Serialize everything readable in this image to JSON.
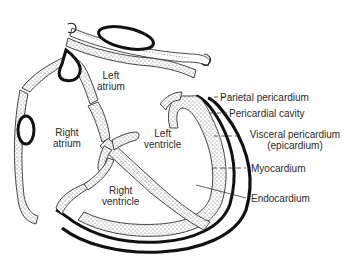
{
  "diagram": {
    "chambers": [
      {
        "id": "left-atrium",
        "line1": "Left",
        "line2": "atrium"
      },
      {
        "id": "right-atrium",
        "line1": "Right",
        "line2": "atrium"
      },
      {
        "id": "left-ventricle",
        "line1": "Left",
        "line2": "ventricle"
      },
      {
        "id": "right-ventricle",
        "line1": "Right",
        "line2": "ventricle"
      }
    ],
    "layer_labels": [
      {
        "id": "parietal-pericardium",
        "text": "Parietal pericardium"
      },
      {
        "id": "pericardial-cavity",
        "text": "Pericardial cavity"
      },
      {
        "id": "visceral-pericardium",
        "text": "Visceral pericardium",
        "text2": "(epicardium)"
      },
      {
        "id": "myocardium",
        "text": "Myocardium"
      },
      {
        "id": "endocardium",
        "text": "Endocardium"
      }
    ],
    "colors": {
      "outline": "#111111",
      "stipple": "#555555",
      "label_text": "#2a2a2a",
      "background": "#ffffff"
    }
  }
}
